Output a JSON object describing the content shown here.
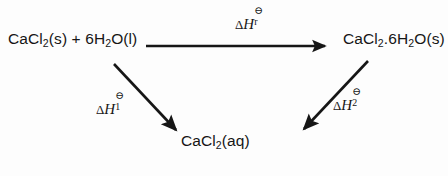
{
  "diagram": {
    "kind": "hess-law-energy-cycle",
    "background_color": "#fdfdfd",
    "ink_color": "#161616",
    "nodes": {
      "reactants": {
        "label": "CaCl2(s) + 6H2O(l)",
        "parts": [
          "CaCl",
          "2",
          "(s) + 6H",
          "2",
          "O(l)"
        ]
      },
      "hydrate": {
        "label": "CaCl2.6H2O(s)",
        "parts": [
          "CaCl",
          "2",
          ".6H",
          "2",
          "O(s)"
        ]
      },
      "aqueous": {
        "label": "CaCl2(aq)",
        "parts": [
          "CaCl",
          "2",
          "(aq)"
        ]
      }
    },
    "arrows": {
      "reaction": {
        "name": "reactants-to-hydrate",
        "direction": "right",
        "from": [
          146,
          46
        ],
        "to": [
          330,
          46
        ]
      },
      "dissolve_anhydrous": {
        "name": "reactants-to-aqueous",
        "direction": "down-right",
        "from": [
          114,
          64
        ],
        "to": [
          180,
          134
        ]
      },
      "dissolve_hydrate": {
        "name": "hydrate-to-aqueous",
        "direction": "down-left",
        "from": [
          368,
          61
        ],
        "to": [
          300,
          133
        ]
      }
    },
    "labels": {
      "reaction": {
        "delta": "Δ",
        "symbol": "H",
        "superscript": "⊖",
        "subscript": "r",
        "plain": "ΔH⊖r"
      },
      "step_one": {
        "delta": "Δ",
        "symbol": "H",
        "superscript": "⊖",
        "subscript": "1",
        "plain": "ΔH⊖1"
      },
      "step_two": {
        "delta": "Δ",
        "symbol": "H",
        "superscript": "⊖",
        "subscript": "2",
        "plain": "ΔH⊖2"
      }
    }
  }
}
